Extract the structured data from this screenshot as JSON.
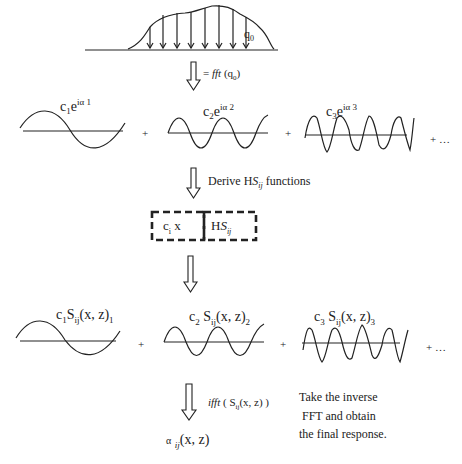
{
  "diagram": {
    "load": {
      "label": "q",
      "label_sub": "0"
    },
    "step1": {
      "prefix": "= ",
      "fn": "fft",
      "arg": " (q",
      "arg_sub": "0",
      "arg_end": ")"
    },
    "terms1": [
      {
        "c": "c",
        "sub": "1",
        "e": "e",
        "sup": "iα 1"
      },
      {
        "c": "c",
        "sub": "2",
        "e": "e",
        "sup": "iα 2"
      },
      {
        "c": "c",
        "sub": "3",
        "e": "e",
        "sup": "iα 3"
      }
    ],
    "plus": "+",
    "ellipsis": "+ …",
    "step2": {
      "text_a": "Derive H",
      "text_s": "S",
      "text_ij": "ij",
      "text_b": " functions"
    },
    "box": {
      "left": "c",
      "left_sub": "i",
      "left_x": " x",
      "right_h": "H",
      "right_s": "S",
      "right_ij": "ij"
    },
    "terms2": [
      {
        "c": "c",
        "sub": "1",
        "s": "S",
        "ij": "ij",
        "args": "(x, z)",
        "n": "1"
      },
      {
        "c": "c",
        "sub": "2",
        "s": " S",
        "ij": "ij",
        "args": "(x, z)",
        "n": "2"
      },
      {
        "c": "c",
        "sub": "3",
        "s": " S",
        "ij": "ij",
        "args": "(x, z)",
        "n": "3"
      }
    ],
    "step3": {
      "fn": "ifft",
      "open": " ( S",
      "ij": "ij",
      "args": "(x, z) )"
    },
    "result": {
      "alpha": "α",
      "ij": "ij",
      "args": "(x, z)"
    },
    "note": [
      "Take the inverse",
      "FFT and obtain",
      "the final response."
    ]
  }
}
